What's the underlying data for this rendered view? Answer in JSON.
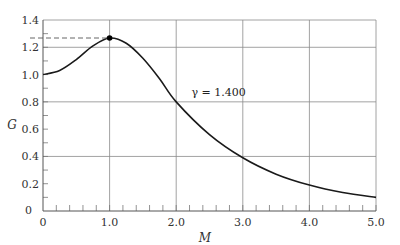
{
  "chart_data": {
    "type": "line",
    "title": "",
    "xlabel": "M",
    "ylabel": "G",
    "xlim": [
      0,
      5.0
    ],
    "ylim": [
      0,
      1.4
    ],
    "grid": true,
    "x_ticks": [
      "0",
      "1.0",
      "2.0",
      "3.0",
      "4.0",
      "5.0"
    ],
    "y_ticks": [
      "0",
      "0.2",
      "0.4",
      "0.6",
      "0.8",
      "1.0",
      "1.2",
      "1.4"
    ],
    "series": [
      {
        "name": "γ = 1.400",
        "x": [
          0,
          0.25,
          0.5,
          0.75,
          1.0,
          1.25,
          1.5,
          1.75,
          2.0,
          2.5,
          3.0,
          3.5,
          4.0,
          4.5,
          5.0
        ],
        "values": [
          1.0,
          1.03,
          1.11,
          1.21,
          1.268,
          1.23,
          1.12,
          0.97,
          0.8,
          0.56,
          0.39,
          0.27,
          0.19,
          0.135,
          0.1
        ]
      }
    ],
    "annotations": [
      {
        "text": "γ = 1.400",
        "x": 2.35,
        "y": 0.87
      },
      {
        "type": "max-point",
        "x": 1.0,
        "y": 1.268,
        "dashed_line_to_y_axis": true
      }
    ]
  }
}
